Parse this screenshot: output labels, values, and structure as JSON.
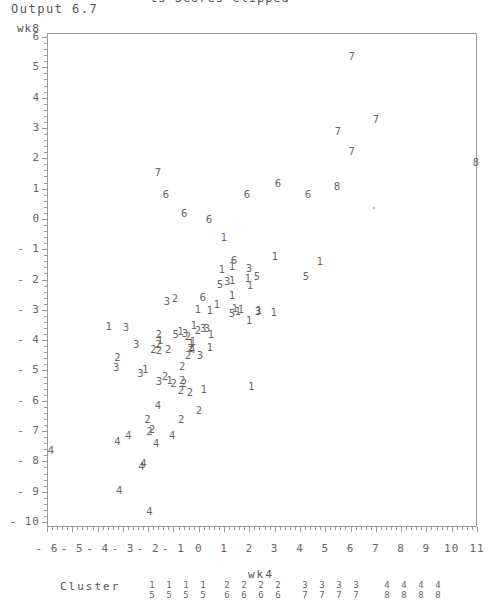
{
  "header": {
    "top_line": "ts Scores Clipped",
    "output_label": "Output 6.7"
  },
  "chart_data": {
    "type": "scatter",
    "title": "",
    "xlabel": "wk4",
    "ylabel": "wk8",
    "xlim": [
      -6,
      11
    ],
    "ylim": [
      -10,
      6
    ],
    "grid": false,
    "x_ticks": [
      "-6",
      "-5",
      "-4",
      "-3",
      "-2",
      "-1",
      "0",
      "1",
      "2",
      "3",
      "4",
      "5",
      "6",
      "7",
      "8",
      "9",
      "10",
      "11"
    ],
    "y_ticks": [
      "6",
      "5",
      "4",
      "3",
      "2",
      "1",
      "0",
      "-1",
      "-2",
      "-3",
      "-4",
      "-5",
      "-6",
      "-7",
      "-8",
      "-9",
      "-10"
    ],
    "legend": {
      "title": "Cluster",
      "position": "bottom",
      "entries": [
        {
          "top": "1",
          "bottom": "5"
        },
        {
          "top": "1",
          "bottom": "5"
        },
        {
          "top": "1",
          "bottom": "5"
        },
        {
          "top": "1",
          "bottom": "5"
        },
        {
          "top": "2",
          "bottom": "6"
        },
        {
          "top": "2",
          "bottom": "6"
        },
        {
          "top": "2",
          "bottom": "6"
        },
        {
          "top": "2",
          "bottom": "6"
        },
        {
          "top": "3",
          "bottom": "7"
        },
        {
          "top": "3",
          "bottom": "7"
        },
        {
          "top": "3",
          "bottom": "7"
        },
        {
          "top": "3",
          "bottom": "7"
        },
        {
          "top": "4",
          "bottom": "8"
        },
        {
          "top": "4",
          "bottom": "8"
        },
        {
          "top": "4",
          "bottom": "8"
        },
        {
          "top": "4",
          "bottom": "8"
        }
      ]
    },
    "points": [
      {
        "x": 6.05,
        "y": 5.34,
        "label": "7"
      },
      {
        "x": 7.0,
        "y": 3.26,
        "label": "7"
      },
      {
        "x": 5.5,
        "y": 2.86,
        "label": "7"
      },
      {
        "x": 6.05,
        "y": 2.2,
        "label": "7"
      },
      {
        "x": 10.96,
        "y": 1.84,
        "label": "8"
      },
      {
        "x": 5.46,
        "y": 1.05,
        "label": "8"
      },
      {
        "x": -1.61,
        "y": 1.51,
        "label": "7"
      },
      {
        "x": -1.3,
        "y": 0.79,
        "label": "6"
      },
      {
        "x": -0.58,
        "y": 0.16,
        "label": "6"
      },
      {
        "x": 0.4,
        "y": -0.04,
        "label": "6"
      },
      {
        "x": 1.9,
        "y": 0.79,
        "label": "6"
      },
      {
        "x": 3.13,
        "y": 1.15,
        "label": "6"
      },
      {
        "x": 4.32,
        "y": 0.79,
        "label": "6"
      },
      {
        "x": 1.0,
        "y": -0.63,
        "label": "1"
      },
      {
        "x": 3.01,
        "y": -1.26,
        "label": "1"
      },
      {
        "x": 4.79,
        "y": -1.43,
        "label": "1"
      },
      {
        "x": 1.39,
        "y": -1.39,
        "label": "6"
      },
      {
        "x": 0.92,
        "y": -1.69,
        "label": "1"
      },
      {
        "x": 1.32,
        "y": -1.59,
        "label": "1"
      },
      {
        "x": 1.98,
        "y": -1.66,
        "label": "3"
      },
      {
        "x": 4.24,
        "y": -1.92,
        "label": "5"
      },
      {
        "x": 1.94,
        "y": -1.99,
        "label": "1"
      },
      {
        "x": 2.3,
        "y": -1.92,
        "label": "5"
      },
      {
        "x": 0.84,
        "y": -2.19,
        "label": "5"
      },
      {
        "x": 1.12,
        "y": -2.09,
        "label": "3"
      },
      {
        "x": 1.32,
        "y": -2.06,
        "label": "1"
      },
      {
        "x": 2.03,
        "y": -2.22,
        "label": "1"
      },
      {
        "x": 1.32,
        "y": -2.55,
        "label": "1"
      },
      {
        "x": -1.26,
        "y": -2.75,
        "label": "3"
      },
      {
        "x": -0.94,
        "y": -2.65,
        "label": "2"
      },
      {
        "x": 0.16,
        "y": -2.62,
        "label": "6"
      },
      {
        "x": -0.03,
        "y": -3.02,
        "label": "1"
      },
      {
        "x": 0.44,
        "y": -3.05,
        "label": "1"
      },
      {
        "x": 0.72,
        "y": -2.85,
        "label": "1"
      },
      {
        "x": 1.32,
        "y": -3.15,
        "label": "5"
      },
      {
        "x": 1.55,
        "y": -3.08,
        "label": "1"
      },
      {
        "x": 1.43,
        "y": -2.98,
        "label": "1"
      },
      {
        "x": 1.67,
        "y": -3.02,
        "label": "1"
      },
      {
        "x": 2.38,
        "y": -3.05,
        "label": "1"
      },
      {
        "x": 2.34,
        "y": -3.08,
        "label": "3"
      },
      {
        "x": 2.97,
        "y": -3.12,
        "label": "1"
      },
      {
        "x": 1.99,
        "y": -3.38,
        "label": "1"
      },
      {
        "x": -3.55,
        "y": -3.58,
        "label": "1"
      },
      {
        "x": -2.88,
        "y": -3.61,
        "label": "3"
      },
      {
        "x": -1.58,
        "y": -3.84,
        "label": "2"
      },
      {
        "x": -0.91,
        "y": -3.84,
        "label": "5"
      },
      {
        "x": -0.71,
        "y": -3.74,
        "label": "1"
      },
      {
        "x": -0.55,
        "y": -3.81,
        "label": "3"
      },
      {
        "x": -0.43,
        "y": -3.91,
        "label": "2"
      },
      {
        "x": -0.19,
        "y": -3.54,
        "label": "1"
      },
      {
        "x": -0.03,
        "y": -3.71,
        "label": "2"
      },
      {
        "x": 0.17,
        "y": -3.64,
        "label": "3"
      },
      {
        "x": 0.32,
        "y": -3.64,
        "label": "3"
      },
      {
        "x": 0.48,
        "y": -3.84,
        "label": "1"
      },
      {
        "x": -0.23,
        "y": -4.07,
        "label": "1"
      },
      {
        "x": 0.44,
        "y": -4.27,
        "label": "1"
      },
      {
        "x": -2.47,
        "y": -4.17,
        "label": "3"
      },
      {
        "x": -1.79,
        "y": -4.34,
        "label": "2"
      },
      {
        "x": -1.6,
        "y": -4.17,
        "label": "2"
      },
      {
        "x": -1.53,
        "y": -4.04,
        "label": "1"
      },
      {
        "x": -1.57,
        "y": -4.37,
        "label": "2"
      },
      {
        "x": -1.21,
        "y": -4.34,
        "label": "2"
      },
      {
        "x": -0.34,
        "y": -4.3,
        "label": "2"
      },
      {
        "x": -0.3,
        "y": -4.14,
        "label": "1"
      },
      {
        "x": -0.26,
        "y": -4.34,
        "label": "4"
      },
      {
        "x": -0.42,
        "y": -4.54,
        "label": "2"
      },
      {
        "x": 0.05,
        "y": -4.54,
        "label": "3"
      },
      {
        "x": -3.22,
        "y": -4.6,
        "label": "2"
      },
      {
        "x": -3.26,
        "y": -4.93,
        "label": "3"
      },
      {
        "x": -2.31,
        "y": -5.13,
        "label": "3"
      },
      {
        "x": -2.11,
        "y": -5.0,
        "label": "1"
      },
      {
        "x": -0.66,
        "y": -4.9,
        "label": "2"
      },
      {
        "x": -1.57,
        "y": -5.39,
        "label": "3"
      },
      {
        "x": -1.34,
        "y": -5.2,
        "label": "2"
      },
      {
        "x": -1.15,
        "y": -5.36,
        "label": "1"
      },
      {
        "x": -0.99,
        "y": -5.46,
        "label": "2"
      },
      {
        "x": -0.59,
        "y": -5.46,
        "label": "2"
      },
      {
        "x": -0.66,
        "y": -5.36,
        "label": "2"
      },
      {
        "x": -0.7,
        "y": -5.69,
        "label": "2"
      },
      {
        "x": -0.35,
        "y": -5.76,
        "label": "2"
      },
      {
        "x": 0.2,
        "y": -5.65,
        "label": "1"
      },
      {
        "x": 2.08,
        "y": -5.53,
        "label": "1"
      },
      {
        "x": -1.61,
        "y": -6.18,
        "label": "4"
      },
      {
        "x": 0.01,
        "y": -6.35,
        "label": "2"
      },
      {
        "x": -2.03,
        "y": -6.65,
        "label": "2"
      },
      {
        "x": -0.69,
        "y": -6.65,
        "label": "2"
      },
      {
        "x": -1.95,
        "y": -7.04,
        "label": "2"
      },
      {
        "x": -2.78,
        "y": -7.17,
        "label": "4"
      },
      {
        "x": -3.22,
        "y": -7.37,
        "label": "4"
      },
      {
        "x": -1.84,
        "y": -6.97,
        "label": "2"
      },
      {
        "x": -1.05,
        "y": -7.17,
        "label": "4"
      },
      {
        "x": -1.68,
        "y": -7.44,
        "label": "4"
      },
      {
        "x": -5.84,
        "y": -7.67,
        "label": "4"
      },
      {
        "x": -2.19,
        "y": -8.1,
        "label": "4"
      },
      {
        "x": -2.27,
        "y": -8.2,
        "label": "4"
      },
      {
        "x": -3.15,
        "y": -8.99,
        "label": "4"
      },
      {
        "x": -1.95,
        "y": -9.68,
        "label": "4"
      }
    ],
    "markers": [
      {
        "x": 6.88,
        "y": 0.39,
        "label": "·"
      }
    ]
  }
}
